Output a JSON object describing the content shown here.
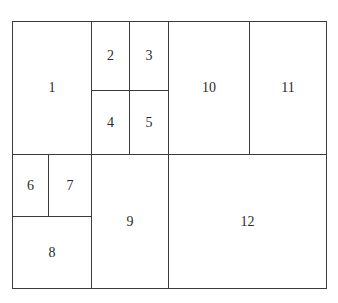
{
  "diagram": {
    "type": "rectangular-partition",
    "line_color": "#3a3a3a",
    "text_color": "#2b2b2b",
    "background": "#ffffff",
    "cells": [
      {
        "id": "1",
        "label": "1",
        "x": 12,
        "y": 21,
        "w": 80,
        "h": 134
      },
      {
        "id": "2",
        "label": "2",
        "x": 91,
        "y": 21,
        "w": 39,
        "h": 70
      },
      {
        "id": "3",
        "label": "3",
        "x": 129,
        "y": 21,
        "w": 40,
        "h": 70
      },
      {
        "id": "4",
        "label": "4",
        "x": 91,
        "y": 90,
        "w": 39,
        "h": 65
      },
      {
        "id": "5",
        "label": "5",
        "x": 129,
        "y": 90,
        "w": 40,
        "h": 65
      },
      {
        "id": "10",
        "label": "10",
        "x": 168,
        "y": 21,
        "w": 82,
        "h": 134
      },
      {
        "id": "11",
        "label": "11",
        "x": 249,
        "y": 21,
        "w": 78,
        "h": 134
      },
      {
        "id": "6",
        "label": "6",
        "x": 12,
        "y": 154,
        "w": 37,
        "h": 63
      },
      {
        "id": "7",
        "label": "7",
        "x": 48,
        "y": 154,
        "w": 44,
        "h": 63
      },
      {
        "id": "8",
        "label": "8",
        "x": 12,
        "y": 216,
        "w": 80,
        "h": 73
      },
      {
        "id": "9",
        "label": "9",
        "x": 91,
        "y": 154,
        "w": 78,
        "h": 135
      },
      {
        "id": "12",
        "label": "12",
        "x": 168,
        "y": 154,
        "w": 159,
        "h": 135
      }
    ]
  }
}
